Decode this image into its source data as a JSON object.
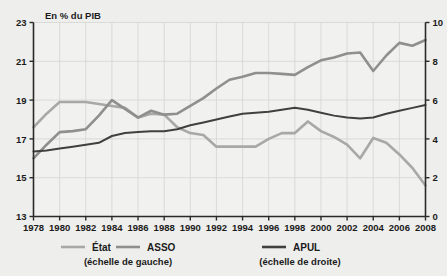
{
  "figure": {
    "unit_label": "En % du PIB",
    "ghost_text": ""
  },
  "legend": {
    "items": [
      {
        "key": "etat",
        "label": "État",
        "color": "#a8a8a6",
        "scale_note": "(échelle de gauche)"
      },
      {
        "key": "asso",
        "label": "ASSO",
        "color": "#8f8f8d",
        "scale_note": "(échelle de gauche)"
      },
      {
        "key": "apul",
        "label": "APUL",
        "color": "#404040",
        "scale_note": "(échelle de droite)"
      }
    ],
    "left_scale_note": "(échelle de gauche)",
    "right_scale_note": "(échelle de droite)"
  },
  "colors": {
    "background": "#eeeeec",
    "axis": "#2a2a2a",
    "grid": "#d4d4d2",
    "etat": "#a8a8a6",
    "asso": "#8f8f8d",
    "apul": "#404040"
  },
  "chart_data": {
    "type": "line",
    "title": "",
    "xlabel": "",
    "ylabel": "En % du PIB",
    "grid": true,
    "legend_position": "bottom",
    "x": [
      1978,
      1979,
      1980,
      1981,
      1982,
      1983,
      1984,
      1985,
      1986,
      1987,
      1988,
      1989,
      1990,
      1991,
      1992,
      1993,
      1994,
      1995,
      1996,
      1997,
      1998,
      1999,
      2000,
      2001,
      2002,
      2003,
      2004,
      2005,
      2006,
      2007,
      2008
    ],
    "xticks": [
      1978,
      1980,
      1982,
      1984,
      1986,
      1988,
      1990,
      1992,
      1994,
      1996,
      1998,
      2000,
      2002,
      2004,
      2006,
      2008
    ],
    "xlim": [
      1978,
      2008
    ],
    "left_axis": {
      "label": "En % du PIB",
      "ticks": [
        13,
        15,
        17,
        19,
        21,
        23
      ],
      "ylim": [
        13,
        23
      ],
      "series": [
        "État",
        "ASSO"
      ]
    },
    "right_axis": {
      "ticks": [
        0,
        2,
        4,
        6,
        8,
        10
      ],
      "ylim": [
        0,
        10
      ],
      "series": [
        "APUL"
      ]
    },
    "series": [
      {
        "name": "État",
        "axis": "left",
        "color": "#a8a8a6",
        "values": [
          17.6,
          18.3,
          18.9,
          18.9,
          18.9,
          18.8,
          18.7,
          18.6,
          18.1,
          18.3,
          18.25,
          17.6,
          17.3,
          17.2,
          16.6,
          16.6,
          16.6,
          16.6,
          17.0,
          17.3,
          17.3,
          17.9,
          17.4,
          17.1,
          16.7,
          16.0,
          17.05,
          16.8,
          16.2,
          15.5,
          14.6
        ]
      },
      {
        "name": "ASSO",
        "axis": "left",
        "color": "#8f8f8d",
        "values": [
          16.0,
          16.7,
          17.35,
          17.4,
          17.5,
          18.2,
          19.0,
          18.55,
          18.1,
          18.45,
          18.25,
          18.3,
          18.7,
          19.1,
          19.6,
          20.05,
          20.2,
          20.4,
          20.4,
          20.35,
          20.3,
          20.7,
          21.05,
          21.2,
          21.4,
          21.45,
          20.5,
          21.3,
          21.95,
          21.8,
          22.1
        ]
      },
      {
        "name": "APUL",
        "axis": "right",
        "color": "#404040",
        "values": [
          3.35,
          3.4,
          3.5,
          3.6,
          3.7,
          3.8,
          4.15,
          4.3,
          4.35,
          4.4,
          4.4,
          4.5,
          4.7,
          4.85,
          5.0,
          5.15,
          5.3,
          5.35,
          5.4,
          5.5,
          5.6,
          5.5,
          5.35,
          5.2,
          5.1,
          5.05,
          5.1,
          5.3,
          5.45,
          5.6,
          5.75
        ]
      }
    ]
  }
}
